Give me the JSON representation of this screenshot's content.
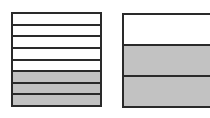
{
  "figures": [
    {
      "id": "left",
      "name": "fraction-bar-eighths",
      "total_parts": 8,
      "shaded_parts": 3,
      "strips": [
        "blank",
        "blank",
        "blank",
        "blank",
        "blank",
        "shaded",
        "shaded",
        "shaded"
      ]
    },
    {
      "id": "right",
      "name": "fraction-bar-thirds",
      "total_parts": 3,
      "shaded_parts": 2,
      "strips": [
        "blank",
        "shaded",
        "shaded"
      ]
    }
  ],
  "colors": {
    "shaded": "#c2c2c2",
    "blank": "#ffffff",
    "outline": "#2a2a2a"
  }
}
